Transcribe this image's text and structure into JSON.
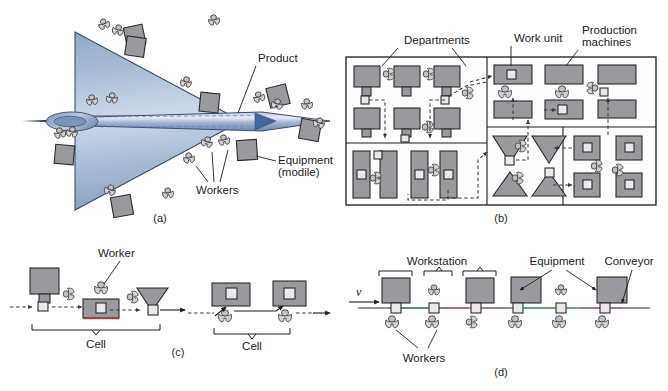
{
  "figure": {
    "panels": [
      {
        "id": "a",
        "caption": "(a)",
        "name": "fixed-position-layout",
        "labels": [
          {
            "key": "product",
            "text": "Product"
          },
          {
            "key": "equipment",
            "text": "Equipment"
          },
          {
            "key": "equipment_note",
            "text": "(modile)"
          },
          {
            "key": "workers",
            "text": "Workers"
          }
        ],
        "icon_counts": {
          "workers": 17,
          "equipment_carts": 7
        }
      },
      {
        "id": "b",
        "caption": "(b)",
        "name": "process-layout",
        "labels": [
          {
            "key": "departments",
            "text": "Departments"
          },
          {
            "key": "work_unit",
            "text": "Work unit"
          },
          {
            "key": "production_machines_l1",
            "text": "Production"
          },
          {
            "key": "production_machines_l2",
            "text": "machines"
          }
        ]
      },
      {
        "id": "c",
        "caption": "(c)",
        "name": "cellular-layout",
        "labels": [
          {
            "key": "worker",
            "text": "Worker"
          },
          {
            "key": "cell_left",
            "text": "Cell"
          },
          {
            "key": "cell_right",
            "text": "Cell"
          }
        ]
      },
      {
        "id": "d",
        "caption": "(d)",
        "name": "product-layout-production-line",
        "labels": [
          {
            "key": "workstation",
            "text": "Workstation"
          },
          {
            "key": "equipment",
            "text": "Equipment"
          },
          {
            "key": "conveyor",
            "text": "Conveyor"
          },
          {
            "key": "workers",
            "text": "Workers"
          },
          {
            "key": "velocity",
            "text": "v"
          }
        ]
      }
    ],
    "colors": {
      "machine_fill": "#9a9a9e",
      "work_unit_fill": "#e9e9ec",
      "outline": "#1c1c1c",
      "aircraft_blue_dark": "#5d7fae",
      "aircraft_blue_mid": "#8aa2c4",
      "aircraft_blue_light": "#dfe7f1",
      "wing_fill": "#9fb2cd",
      "worker_fill": "#d2d2d6",
      "background": "#ffffff"
    }
  }
}
